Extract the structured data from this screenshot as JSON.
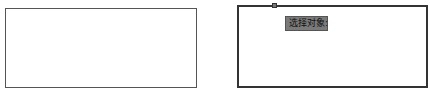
{
  "panels": [
    {
      "name": "before",
      "shape": "rectangle",
      "state": "unselected"
    },
    {
      "name": "after",
      "shape": "rectangle",
      "state": "selected"
    }
  ],
  "tooltip": {
    "label": "选择对象:"
  },
  "colors": {
    "border": "#555555",
    "selected_border": "#333333",
    "tooltip_bg": "#7a7a7a"
  }
}
